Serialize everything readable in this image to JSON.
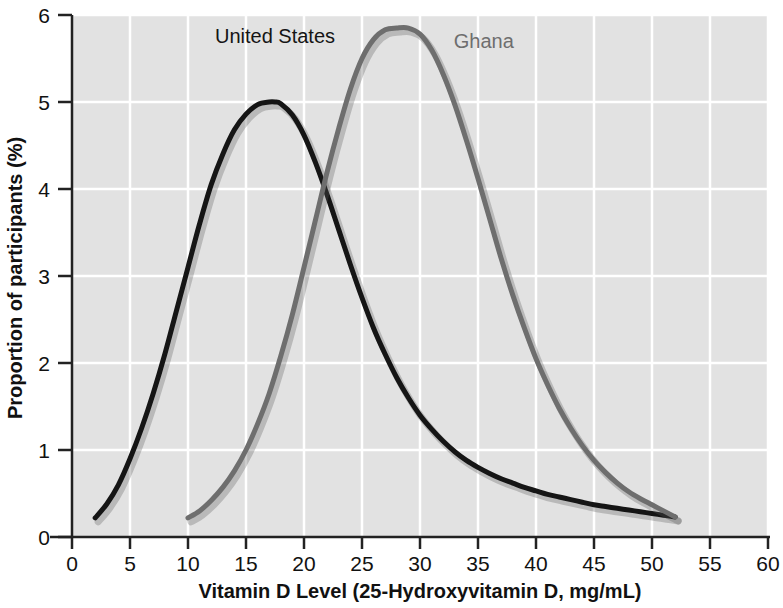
{
  "chart_data": {
    "type": "line",
    "title": "",
    "xlabel": "Vitamin D Level (25-Hydroxyvitamin D, mg/mL)",
    "ylabel": "Proportion of participants (%)",
    "xlim": [
      0,
      60
    ],
    "ylim": [
      0,
      6
    ],
    "xticks": [
      0,
      5,
      10,
      15,
      20,
      25,
      30,
      35,
      40,
      45,
      50,
      55,
      60
    ],
    "yticks": [
      0,
      1,
      2,
      3,
      4,
      5,
      6
    ],
    "xtick_labels": [
      "0",
      "5",
      "10",
      "15",
      "20",
      "25",
      "30",
      "35",
      "40",
      "45",
      "50",
      "55",
      "60"
    ],
    "ytick_labels": [
      "0",
      "1",
      "2",
      "3",
      "4",
      "5",
      "6"
    ],
    "grid": true,
    "grid_color": "#ffffff",
    "plot_background": "#e2e2e2",
    "legend_position": "inline-annotations",
    "series": [
      {
        "name": "United States",
        "color": "#151515",
        "label_x": 17.5,
        "label_y": 5.68,
        "peak_x": 17.5,
        "peak_y": 5.0,
        "x": [
          2,
          3,
          4,
          5,
          6,
          7,
          8,
          9,
          10,
          11,
          12,
          13,
          14,
          15,
          16,
          17,
          17.5,
          18,
          19,
          20,
          21,
          22,
          23,
          24,
          25,
          26,
          27,
          28,
          29,
          30,
          31,
          32,
          33,
          34,
          35,
          36,
          37,
          38,
          39,
          40,
          41,
          42,
          43,
          44,
          45,
          46,
          47,
          48,
          49,
          50,
          51,
          52
        ],
        "y": [
          0.22,
          0.38,
          0.6,
          0.9,
          1.25,
          1.65,
          2.1,
          2.6,
          3.1,
          3.6,
          4.05,
          4.4,
          4.68,
          4.86,
          4.97,
          5.0,
          5.0,
          4.98,
          4.85,
          4.62,
          4.3,
          3.93,
          3.53,
          3.13,
          2.75,
          2.4,
          2.1,
          1.83,
          1.6,
          1.4,
          1.24,
          1.1,
          0.98,
          0.88,
          0.8,
          0.73,
          0.67,
          0.62,
          0.57,
          0.53,
          0.49,
          0.46,
          0.43,
          0.4,
          0.37,
          0.35,
          0.33,
          0.31,
          0.29,
          0.27,
          0.25,
          0.23
        ]
      },
      {
        "name": "Ghana",
        "color": "#6e6e6e",
        "label_x": 35.5,
        "label_y": 5.62,
        "peak_x": 29,
        "peak_y": 5.85,
        "x": [
          10,
          11,
          12,
          13,
          14,
          15,
          16,
          17,
          18,
          19,
          20,
          21,
          22,
          23,
          24,
          25,
          26,
          27,
          28,
          29,
          30,
          31,
          32,
          33,
          34,
          35,
          36,
          37,
          38,
          39,
          40,
          41,
          42,
          43,
          44,
          45,
          46,
          47,
          48,
          49,
          50,
          51,
          52
        ],
        "y": [
          0.22,
          0.3,
          0.42,
          0.57,
          0.76,
          1.0,
          1.3,
          1.65,
          2.08,
          2.56,
          3.1,
          3.65,
          4.2,
          4.7,
          5.15,
          5.5,
          5.72,
          5.83,
          5.85,
          5.85,
          5.78,
          5.6,
          5.32,
          4.97,
          4.56,
          4.12,
          3.66,
          3.2,
          2.78,
          2.4,
          2.05,
          1.75,
          1.48,
          1.25,
          1.05,
          0.88,
          0.74,
          0.62,
          0.52,
          0.44,
          0.37,
          0.3,
          0.23
        ]
      }
    ]
  },
  "axes": {
    "x_title": "Vitamin D Level (25-Hydroxyvitamin D, mg/mL)",
    "y_title": "Proportion of participants (%)"
  },
  "annotations": {
    "us_label": "United States",
    "ghana_label": "Ghana"
  },
  "colors": {
    "united_states": "#151515",
    "ghana": "#6e6e6e",
    "background": "#e2e2e2",
    "grid": "#ffffff",
    "axis": "#222222",
    "text": "#111111"
  }
}
